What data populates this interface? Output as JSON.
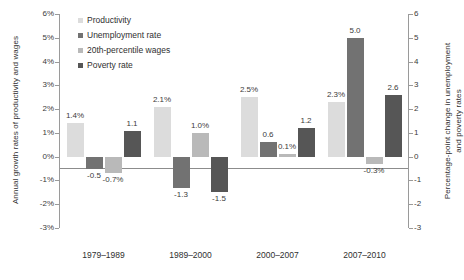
{
  "chart_data": {
    "type": "bar",
    "title": "",
    "subtitle": "",
    "categories": [
      "1979–1989",
      "1989–2000",
      "2000–2007",
      "2007–2010"
    ],
    "series": [
      {
        "name": "Productivity",
        "axis": "left",
        "color": "#dcdcdc",
        "values": [
          1.4,
          2.1,
          2.5,
          2.3
        ],
        "labels": [
          "1.4%",
          "2.1%",
          "2.5%",
          "2.3%"
        ]
      },
      {
        "name": "Unemployment rate",
        "axis": "right",
        "color": "#727272",
        "values": [
          -0.5,
          -1.3,
          0.6,
          5.0
        ],
        "labels": [
          "-0.5",
          "-1.3",
          "0.6",
          "5.0"
        ]
      },
      {
        "name": "20th-percentile wages",
        "axis": "left",
        "color": "#b9b9b9",
        "values": [
          -0.7,
          1.0,
          0.1,
          -0.3
        ],
        "labels": [
          "-0.7%",
          "1.0%",
          "0.1%",
          "-0.3%"
        ]
      },
      {
        "name": "Poverty rate",
        "axis": "right",
        "color": "#565656",
        "values": [
          1.1,
          -1.5,
          1.2,
          2.6
        ],
        "labels": [
          "1.1",
          "-1.5",
          "1.2",
          "2.6"
        ]
      }
    ],
    "left_axis": {
      "label": "Annual growth rates of productivity and wages",
      "ticks": [
        "6%",
        "5%",
        "4%",
        "3%",
        "2%",
        "1%",
        "0%",
        "-1%",
        "-2%",
        "-3%"
      ],
      "values": [
        6,
        5,
        4,
        3,
        2,
        1,
        0,
        -1,
        -2,
        -3
      ],
      "min": -3,
      "max": 6
    },
    "right_axis": {
      "label_line1": "Percentage-point change in unemployment",
      "label_line2": "and poverty rates",
      "ticks": [
        "6",
        "5",
        "4",
        "3",
        "2",
        "1",
        "0",
        "-1",
        "-2",
        "-3"
      ],
      "values": [
        6,
        5,
        4,
        3,
        2,
        1,
        0,
        -1,
        -2,
        -3
      ],
      "min": -3,
      "max": 6
    },
    "legend_position": "top-left",
    "grid": false
  }
}
